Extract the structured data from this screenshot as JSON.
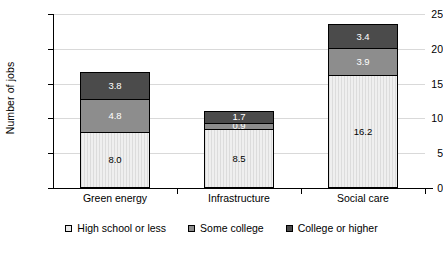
{
  "chart_data": {
    "type": "bar",
    "subtype": "stacked-bar-vertical",
    "title": "",
    "xlabel": "",
    "ylabel": "Number of jobs",
    "ylim": [
      0,
      25
    ],
    "yticks": [
      0,
      5,
      10,
      15,
      20,
      25
    ],
    "ytick_labels": [
      "0",
      "5",
      "10",
      "15",
      "20",
      "25"
    ],
    "grid": "horizontal",
    "legend_position": "bottom-center",
    "categories": [
      "Green energy",
      "Infrastructure",
      "Social care"
    ],
    "series": [
      {
        "name": "High school or less",
        "color": "#e9e9e9",
        "values": [
          8.0,
          8.5,
          16.2
        ],
        "labels": [
          "8.0",
          "8.5",
          "16.2"
        ]
      },
      {
        "name": "Some college",
        "color": "#8d8d8d",
        "values": [
          4.8,
          0.9,
          3.9
        ],
        "labels": [
          "4.8",
          "0.9",
          "3.9"
        ]
      },
      {
        "name": "College or higher",
        "color": "#4b4b4b",
        "values": [
          3.8,
          1.7,
          3.4
        ],
        "labels": [
          "3.8",
          "1.7",
          "3.4"
        ]
      }
    ],
    "totals": [
      16.6,
      11.1,
      23.5
    ]
  },
  "axis": {
    "y_title": "Number of jobs",
    "ticks": [
      {
        "label": "25",
        "value": 25
      },
      {
        "label": "20",
        "value": 20
      },
      {
        "label": "15",
        "value": 15
      },
      {
        "label": "10",
        "value": 10
      },
      {
        "label": "5",
        "value": 5
      },
      {
        "label": "0",
        "value": 0
      }
    ]
  },
  "legend": {
    "items": [
      {
        "label": "High school or less",
        "swatch": "seg-low"
      },
      {
        "label": "Some college",
        "swatch": "seg-mid"
      },
      {
        "label": "College or higher",
        "swatch": "seg-high"
      }
    ]
  }
}
